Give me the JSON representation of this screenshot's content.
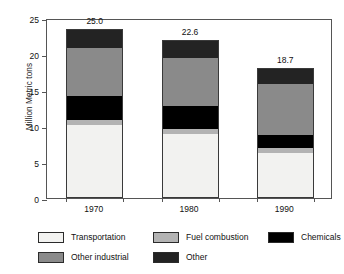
{
  "chart_data": {
    "type": "bar",
    "subtype": "stacked-bar",
    "title": "",
    "xlabel": "",
    "ylabel": "Million Metric tons",
    "categories": [
      "1970",
      "1980",
      "1990"
    ],
    "ylim": [
      0,
      25
    ],
    "yticks": [
      0,
      5,
      10,
      15,
      20,
      25
    ],
    "ytick_labels": [
      "0",
      "5",
      "10",
      "15",
      "20",
      "25"
    ],
    "grid": false,
    "legend_position": "bottom",
    "bar_totals": [
      "25.0",
      "22.6",
      "18.7"
    ],
    "bar_total_values": [
      25.0,
      22.6,
      18.7
    ],
    "series": [
      {
        "name": "Transportation",
        "color": "#f2f2f0",
        "values": [
          10.1,
          8.8,
          6.2
        ]
      },
      {
        "name": "Fuel combustion",
        "color": "#b3b3b3",
        "values": [
          0.7,
          0.7,
          0.7
        ]
      },
      {
        "name": "Chemicals",
        "color": "#000000",
        "values": [
          3.4,
          3.3,
          1.9
        ]
      },
      {
        "name": "Other industrial",
        "color": "#8a8a8a",
        "values": [
          6.8,
          6.8,
          7.2
        ]
      },
      {
        "name": "Other",
        "color": "#232323",
        "values": [
          2.5,
          2.4,
          2.1
        ]
      }
    ]
  },
  "legend": {
    "rows": [
      [
        {
          "label": "Transportation",
          "color": "#f2f2f0"
        },
        {
          "label": "Fuel combustion",
          "color": "#b3b3b3"
        },
        {
          "label": "Chemicals",
          "color": "#000000"
        }
      ],
      [
        {
          "label": "Other industrial",
          "color": "#8a8a8a"
        },
        {
          "label": "Other",
          "color": "#232323"
        }
      ]
    ]
  },
  "colors": {
    "axis": "#555555",
    "text": "#111111",
    "background": "#ffffff",
    "bar_outline": "#3a3a3a"
  }
}
